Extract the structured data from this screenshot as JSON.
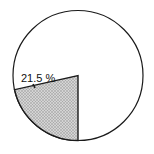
{
  "chart_data": {
    "type": "pie",
    "title": "",
    "slices": [
      {
        "label": "21.5%",
        "value": 21.5,
        "fill": "hatched-gray"
      },
      {
        "label": "",
        "value": 78.5,
        "fill": "white"
      }
    ],
    "annotations": [
      {
        "text": "21.5%",
        "target_slice": 0
      }
    ],
    "legend": null
  },
  "labels": {
    "slice_label": "21.5 %"
  },
  "colors": {
    "stroke": "#1a1a1a",
    "shade": "#bdbdbd",
    "background": "#ffffff"
  }
}
